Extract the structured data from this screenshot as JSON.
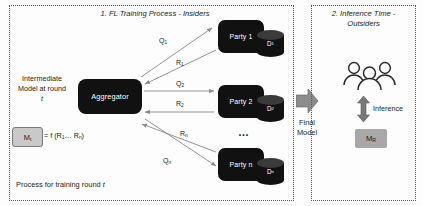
{
  "panels": {
    "left": {
      "title": "1. FL Training Process - Insiders",
      "caption_prefix": "Process for training round ",
      "caption_italic": "t"
    },
    "right": {
      "title": "2. Inference Time - Outsiders"
    }
  },
  "aggregator": {
    "label": "Aggregator"
  },
  "intermediate": {
    "line1": "Intermediate",
    "line2": "Model at round",
    "line3": "t"
  },
  "model_box": {
    "label": "Mt",
    "label_base": "M",
    "label_sub": "t",
    "formula": "= f (R1… Rn)",
    "formula_parts": {
      "lead": "= f (R",
      "sub1": "1",
      "mid": "… R",
      "sub2": "n",
      "tail": ")"
    }
  },
  "parties": [
    {
      "name": "Party 1",
      "dataset_base": "D",
      "dataset_sub": "1",
      "query_label_base": "Q",
      "query_label_sub": "1",
      "response_label_base": "R",
      "response_label_sub": "1"
    },
    {
      "name": "Party 2",
      "dataset_base": "D",
      "dataset_sub": "2",
      "query_label_base": "Q",
      "query_label_sub": "2",
      "response_label_base": "R",
      "response_label_sub": "2"
    },
    {
      "name": "Party n",
      "dataset_base": "D",
      "dataset_sub": "n",
      "query_label_base": "Q",
      "query_label_sub": "n",
      "response_label_base": "R",
      "response_label_sub": "n"
    }
  ],
  "ellipsis": "…",
  "final_model": {
    "line1": "Final",
    "line2": "Model"
  },
  "inference": {
    "label": "Inference",
    "model_base": "M",
    "model_sub": "R"
  },
  "colors": {
    "node_fill": "#111111",
    "cylinder_top": "#3a3a3a",
    "model_box_fill": "#c9c9c9",
    "final_model_fill": "#a8a8a8",
    "arrow_gray": "#8a8a8a",
    "panel_border": "#5a5a5a",
    "text": "#231f20"
  }
}
